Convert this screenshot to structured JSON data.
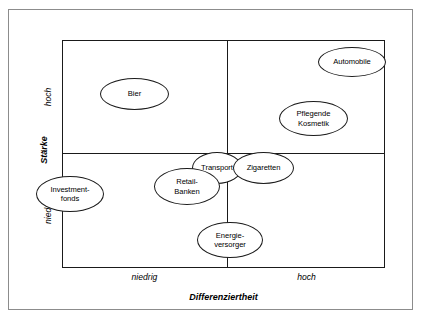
{
  "figure": {
    "type": "positioning-matrix",
    "x_axis": {
      "title": "Differenziertheit",
      "low_label": "niedrig",
      "high_label": "hoch"
    },
    "y_axis": {
      "title": "Stärke",
      "low_label": "niedrig",
      "high_label": "hoch"
    },
    "colors": {
      "frame": "#8c8c8c",
      "plot_border": "#1a1a1a",
      "divider": "#1a1a1a",
      "node_fill": "#ffffff",
      "node_stroke": "#1a1a1a",
      "text": "#000000"
    }
  },
  "chart_data": {
    "type": "scatter",
    "title": "",
    "xlabel": "Differenziertheit",
    "ylabel": "Stärke",
    "xlim": [
      0,
      1
    ],
    "ylim": [
      0,
      1
    ],
    "xtick_labels": [
      "niedrig",
      "hoch"
    ],
    "ytick_labels": [
      "niedrig",
      "hoch"
    ],
    "grid": false,
    "legend": "none",
    "quadrant_split": {
      "x": 0.5,
      "y": 0.5
    },
    "items": [
      {
        "label": "Automobile",
        "x": 0.92,
        "y": 0.9,
        "quadrant": "hoch/hoch"
      },
      {
        "label": "Bier",
        "x": 0.22,
        "y": 0.77,
        "quadrant": "niedrig/hoch"
      },
      {
        "label": "Pflegende\nKosmetik",
        "x": 0.76,
        "y": 0.62,
        "quadrant": "hoch/hoch"
      },
      {
        "label": "Transport",
        "x": 0.46,
        "y": 0.41,
        "quadrant": "niedrig/niedrig"
      },
      {
        "label": "Zigaretten",
        "x": 0.6,
        "y": 0.4,
        "quadrant": "hoch/niedrig"
      },
      {
        "label": "Retail-\nBanken",
        "x": 0.35,
        "y": 0.32,
        "quadrant": "niedrig/niedrig"
      },
      {
        "label": "Investment-\nfonds",
        "x": 0.04,
        "y": 0.29,
        "quadrant": "niedrig/niedrig"
      },
      {
        "label": "Energie-\nversorger",
        "x": 0.5,
        "y": 0.12,
        "quadrant": "niedrig/niedrig"
      }
    ]
  },
  "nodes": [
    {
      "label": "Automobile",
      "left": 318,
      "top": 47,
      "width": 68,
      "height": 30
    },
    {
      "label": "Bier",
      "left": 100,
      "top": 78,
      "width": 69,
      "height": 32
    },
    {
      "label": "Pflegende\nKosmetik",
      "left": 279,
      "top": 101,
      "width": 69,
      "height": 35
    },
    {
      "label": "Transport",
      "left": 192,
      "top": 152,
      "width": 50,
      "height": 32
    },
    {
      "label": "Zigaretten",
      "left": 233,
      "top": 152,
      "width": 61,
      "height": 32
    },
    {
      "label": "Retail-\nBanken",
      "left": 154,
      "top": 168,
      "width": 66,
      "height": 37
    },
    {
      "label": "Investment-\nfonds",
      "left": 36,
      "top": 176,
      "width": 68,
      "height": 36
    },
    {
      "label": "Energie-\nversorger",
      "left": 197,
      "top": 222,
      "width": 66,
      "height": 36
    }
  ]
}
